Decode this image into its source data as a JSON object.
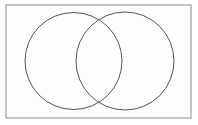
{
  "figure": {
    "name": "venn-diagram",
    "type": "venn",
    "canvas": {
      "width": 198,
      "height": 125,
      "background": "#ffffff"
    },
    "frame": {
      "name": "outer-rectangle",
      "x": 6,
      "y": 5,
      "width": 185,
      "height": 113,
      "stroke": "#8a8a8a",
      "stroke_width": 1,
      "fill": "#fdfdfd"
    },
    "sets": [
      {
        "label": "",
        "name": "left-circle",
        "cx": 73.5,
        "cy": 61,
        "r": 48.5,
        "stroke": "#555555",
        "stroke_width": 1,
        "fill": "none"
      },
      {
        "label": "",
        "name": "right-circle",
        "cx": 125,
        "cy": 61,
        "r": 49,
        "stroke": "#555555",
        "stroke_width": 1,
        "fill": "none"
      }
    ],
    "intersection_points": [
      {
        "x": 99,
        "y": 20
      },
      {
        "x": 99,
        "y": 102
      }
    ],
    "labels": []
  }
}
